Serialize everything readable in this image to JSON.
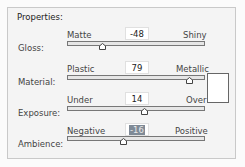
{
  "panel": {
    "title": "Properties:"
  },
  "properties": [
    {
      "label": "Gloss:",
      "min_label": "Matte",
      "max_label": "Shiny",
      "value": "-48",
      "selected": false,
      "thumb_x": 103
    },
    {
      "label": "Material:",
      "min_label": "Plastic",
      "max_label": "Metallic",
      "value": "79",
      "selected": false,
      "thumb_x": 190
    },
    {
      "label": "Exposure:",
      "min_label": "Under",
      "max_label": "Over",
      "value": "14",
      "selected": false,
      "thumb_x": 145
    },
    {
      "label": "Ambience:",
      "min_label": "Negative",
      "max_label": "Positive",
      "value": "-16",
      "selected": true,
      "thumb_x": 124
    }
  ],
  "swatch": {
    "color": "#ffffff"
  }
}
